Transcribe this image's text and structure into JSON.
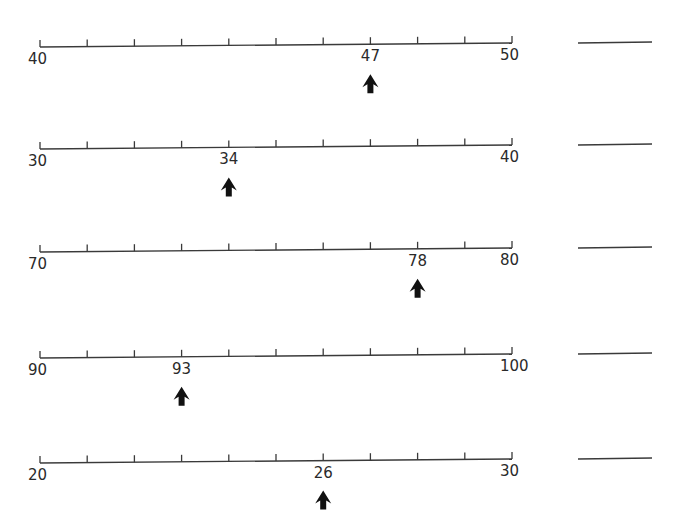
{
  "worksheet": {
    "rows": [
      {
        "start": 40,
        "end": 50,
        "marked": 47,
        "y_left": 47,
        "y_right": 43,
        "answer_line": true
      },
      {
        "start": 30,
        "end": 40,
        "marked": 34,
        "y_left": 149,
        "y_right": 145,
        "answer_line": true
      },
      {
        "start": 70,
        "end": 80,
        "marked": 78,
        "y_left": 252,
        "y_right": 248,
        "answer_line": true
      },
      {
        "start": 90,
        "end": 100,
        "marked": 93,
        "y_left": 358,
        "y_right": 354,
        "answer_line": true
      },
      {
        "start": 20,
        "end": 30,
        "marked": 26,
        "y_left": 463,
        "y_right": 459,
        "answer_line": true
      }
    ],
    "ticks_per_line": 11,
    "line_color": "#3a3a3a",
    "arrow_color": "#111111"
  }
}
